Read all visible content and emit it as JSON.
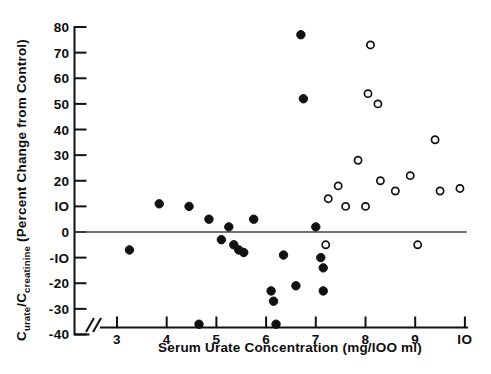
{
  "chart_data": {
    "type": "scatter",
    "title": "",
    "xlabel": "Serum Urate Concentration  (mg/IOO ml)",
    "ylabel": "Curate/Ccreatinine  (Percent Change from Control)",
    "ylabel_parts": {
      "c1_main": "C",
      "c1_sub": "urate",
      "slash": "/",
      "c2_main": "C",
      "c2_sub": "creatinine",
      "paren": "(Percent Change from Control)"
    },
    "xlabel_parts": {
      "main": "Serum Urate Concentration",
      "units": "(mg/IOO ml)"
    },
    "xlim": [
      2.55,
      10.25
    ],
    "ylim": [
      -40,
      80
    ],
    "xticks": [
      3,
      4,
      5,
      6,
      7,
      8,
      9,
      10
    ],
    "xticklabels": [
      "3",
      "4",
      "5",
      "6",
      "7",
      "8",
      "9",
      "IO"
    ],
    "yticks": [
      -40,
      -30,
      -20,
      -10,
      0,
      10,
      20,
      30,
      40,
      50,
      60,
      70,
      80
    ],
    "yticklabels": [
      "-40",
      "-30",
      "-20",
      "-IO",
      "0",
      "IO",
      "20",
      "30",
      "40",
      "50",
      "60",
      "70",
      "80"
    ],
    "grid": false,
    "legend": "none",
    "axis_break": true,
    "axis_break_label": "//",
    "zero_reference_line": 0,
    "series": [
      {
        "name": "filled",
        "marker": "filled-circle",
        "color": "#111111",
        "points": [
          [
            3.25,
            -7
          ],
          [
            3.85,
            11
          ],
          [
            4.45,
            10
          ],
          [
            4.65,
            -36
          ],
          [
            4.85,
            5
          ],
          [
            5.1,
            -3
          ],
          [
            5.25,
            2
          ],
          [
            5.35,
            -5
          ],
          [
            5.45,
            -7
          ],
          [
            5.55,
            -8
          ],
          [
            5.75,
            5
          ],
          [
            6.1,
            -23
          ],
          [
            6.15,
            -27
          ],
          [
            6.2,
            -36
          ],
          [
            6.35,
            -9
          ],
          [
            6.6,
            -21
          ],
          [
            6.7,
            77
          ],
          [
            6.75,
            52
          ],
          [
            7.0,
            2
          ],
          [
            7.1,
            -10
          ],
          [
            7.15,
            -14
          ],
          [
            7.15,
            -23
          ]
        ]
      },
      {
        "name": "open",
        "marker": "open-circle",
        "color": "#111111",
        "points": [
          [
            7.2,
            -5
          ],
          [
            7.25,
            13
          ],
          [
            7.45,
            18
          ],
          [
            7.6,
            10
          ],
          [
            7.85,
            28
          ],
          [
            8.0,
            10
          ],
          [
            8.05,
            54
          ],
          [
            8.1,
            73
          ],
          [
            8.25,
            50
          ],
          [
            8.3,
            20
          ],
          [
            8.6,
            16
          ],
          [
            8.9,
            22
          ],
          [
            9.05,
            -5
          ],
          [
            9.4,
            36
          ],
          [
            9.5,
            16
          ],
          [
            9.9,
            17
          ]
        ]
      }
    ]
  }
}
